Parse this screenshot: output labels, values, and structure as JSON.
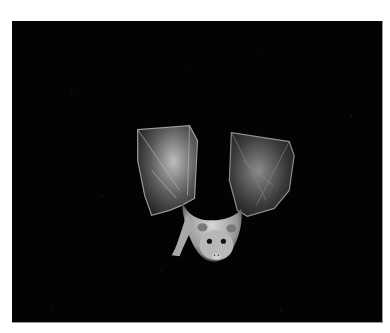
{
  "image": {
    "subject": "bat in flight",
    "alt": "A bat flying with wings raised against a black night background",
    "background_color": "#030303",
    "subject_color": "#cfcfcf",
    "frame_border_color": "#9a9a9a",
    "page_background": "#ffffff"
  }
}
